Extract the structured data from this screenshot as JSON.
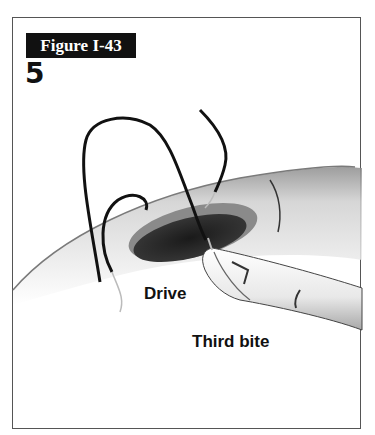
{
  "figure": {
    "label": "Figure I-43",
    "step_number": "5"
  },
  "annotations": {
    "drive": "Drive",
    "third_bite": "Third bite"
  },
  "illustration": {
    "subject": "suturing-through-incision",
    "colors": {
      "suture": "#111111",
      "tissue_shade": "#9a9a9a",
      "opening": "#2e2e2e",
      "frame_border": "#555555",
      "label_bg": "#111111"
    }
  }
}
